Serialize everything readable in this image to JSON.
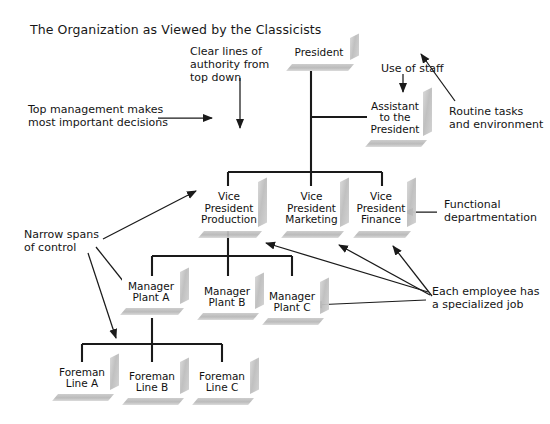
{
  "diagram": {
    "title": "The Organization as Viewed by the Classicists",
    "type": "organizational-chart",
    "nodes": {
      "president": "President",
      "assistant": "Assistant\nto the\nPresident",
      "vp_production": "Vice\nPresident\nProduction",
      "vp_marketing": "Vice\nPresident\nMarketing",
      "vp_finance": "Vice\nPresident\nFinance",
      "manager_a": "Manager\nPlant A",
      "manager_b": "Manager\nPlant B",
      "manager_c": "Manager\nPlant C",
      "foreman_a": "Foreman\nLine A",
      "foreman_b": "Foreman\nLine B",
      "foreman_c": "Foreman\nLine C"
    },
    "annotations": {
      "clear_lines": "Clear lines of\nauthority from\ntop down",
      "top_management": "Top management makes\nmost important decisions",
      "use_of_staff": "Use of staff",
      "routine_tasks": "Routine tasks\nand environment",
      "functional_dept": "Functional\ndepartmentation",
      "narrow_spans": "Narrow spans\nof control",
      "specialized_job": "Each employee has\na specialized job"
    },
    "colors": {
      "line": "#1a1a1a",
      "box_face": "#ffffff",
      "box_shadow": "#c0c0c0",
      "text": "#111111",
      "background": "#ffffff"
    }
  }
}
